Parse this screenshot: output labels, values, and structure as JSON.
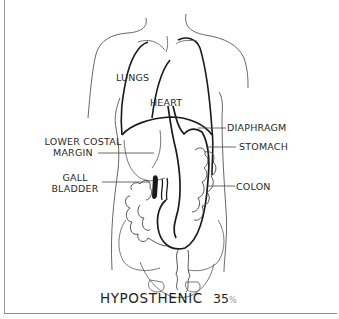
{
  "diagram": {
    "title": "HYPOSTHENIC",
    "percentage": "35",
    "percentage_symbol": "%",
    "labels": {
      "lungs": "LUNGS",
      "heart": "HEART",
      "lower_costal_margin_line1": "LOWER COSTAL",
      "lower_costal_margin_line2": "MARGIN",
      "diaphragm": "DIAPHRAGM",
      "stomach": "STOMACH",
      "gall_bladder_line1": "GALL",
      "gall_bladder_line2": "BLADDER",
      "colon": "COLON"
    },
    "colors": {
      "line_heavy": "#1a1a1a",
      "line_light": "#555555",
      "text": "#2a2a2a",
      "border": "#9a9a9a"
    }
  }
}
